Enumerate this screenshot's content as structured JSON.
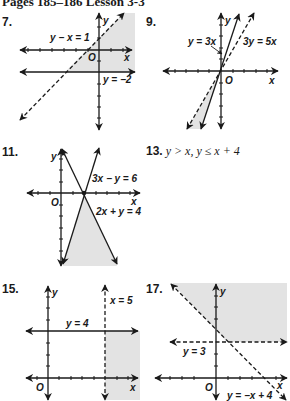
{
  "header": {
    "title": "Pages 185–186  Lesson 3-3"
  },
  "problems": [
    {
      "number": "7.",
      "type": "graph",
      "labels": {
        "line1": "y − x = 1",
        "line2": "y = −2",
        "x_axis": "x",
        "y_axis": "y",
        "origin": "O"
      }
    },
    {
      "number": "9.",
      "type": "graph",
      "labels": {
        "line1": "y = 3x",
        "line2": "3y = 5x",
        "x_axis": "x",
        "y_axis": "y",
        "origin": "O"
      }
    },
    {
      "number": "11.",
      "type": "graph",
      "labels": {
        "line1": "3x − y = 6",
        "line2": "2x + y = 4",
        "x_axis": "x",
        "y_axis": "y",
        "origin": "O"
      }
    },
    {
      "number": "13.",
      "type": "text",
      "answer": "y > x, y ≤ x + 4"
    },
    {
      "number": "15.",
      "type": "graph",
      "labels": {
        "line1": "x = 5",
        "line2": "y = 4",
        "x_axis": "x",
        "y_axis": "y",
        "origin": "O"
      }
    },
    {
      "number": "17.",
      "type": "graph",
      "labels": {
        "line1": "y = 3",
        "line2": "y = −x + 4",
        "x_axis": "x",
        "y_axis": "y",
        "origin": "O"
      }
    }
  ],
  "colors": {
    "shade": "#e3e3e3",
    "ink": "#1a1a1a",
    "background": "#ffffff"
  }
}
